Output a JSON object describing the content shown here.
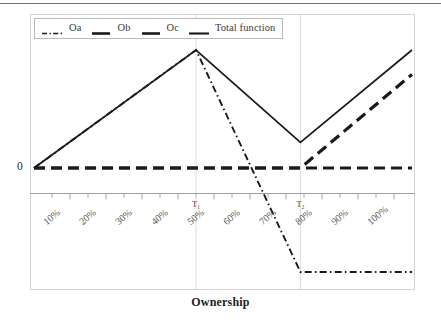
{
  "figure": {
    "axis_title": "Ownership",
    "y_zero_label": "0",
    "top_rule": true
  },
  "legend": {
    "position": "top-left-inside",
    "entries": [
      {
        "label": "Oa",
        "style": "dash-dot",
        "color": "#1a1a1a"
      },
      {
        "label": "Ob",
        "style": "dashed-thick",
        "color": "#1a1a1a"
      },
      {
        "label": "Oc",
        "style": "dashed-thick",
        "color": "#1a1a1a"
      },
      {
        "label": "Total function",
        "style": "solid",
        "color": "#1a1a1a"
      }
    ]
  },
  "axes": {
    "x_label": "Ownership",
    "x_tick_labels": [
      "10%",
      "20%",
      "30%",
      "40%",
      "50%",
      "60%",
      "70%",
      "80%",
      "90%",
      "100%"
    ],
    "x_tick_values": [
      10,
      20,
      30,
      40,
      50,
      60,
      70,
      80,
      90,
      100
    ],
    "x_minor_ticks": true,
    "y_tick_labels": [
      "0"
    ],
    "markers": [
      {
        "label": "T₁",
        "x_percent": 45
      },
      {
        "label": "T₂",
        "x_percent": 74
      }
    ]
  },
  "chart_data": {
    "type": "line",
    "title": "",
    "xlabel": "Ownership",
    "ylabel": "",
    "xlim": [
      0,
      105
    ],
    "ylim": [
      -1.05,
      1.0
    ],
    "grid": false,
    "legend_position": "upper left",
    "x_tick_labels": [
      "10%",
      "20%",
      "30%",
      "40%",
      "50%",
      "60%",
      "70%",
      "80%",
      "90%",
      "100%"
    ],
    "x_ticks": [
      10,
      20,
      30,
      40,
      50,
      60,
      70,
      80,
      90,
      100
    ],
    "y_ticks": [
      0
    ],
    "y_tick_labels": [
      "0"
    ],
    "annotations": [
      {
        "text": "T₁",
        "x": 45,
        "y": -0.17
      },
      {
        "text": "T₂",
        "x": 74,
        "y": -0.17
      }
    ],
    "series": [
      {
        "name": "Oa",
        "style": "dash-dot",
        "color": "#1a1a1a",
        "x": [
          0,
          45,
          74,
          105
        ],
        "y": [
          0.0,
          0.857,
          -0.755,
          -0.755
        ]
      },
      {
        "name": "Ob",
        "style": "dashed",
        "color": "#1a1a1a",
        "x": [
          0,
          45,
          74,
          105
        ],
        "y": [
          0.0,
          0.0,
          0.0,
          0.0
        ]
      },
      {
        "name": "Oc",
        "style": "dashed",
        "color": "#1a1a1a",
        "x": [
          0,
          45,
          74,
          105
        ],
        "y": [
          0.0,
          0.0,
          0.0,
          0.68
        ]
      },
      {
        "name": "Total function",
        "style": "solid",
        "color": "#1a1a1a",
        "x": [
          0,
          45,
          74,
          105
        ],
        "y": [
          0.0,
          0.857,
          0.186,
          0.857
        ]
      }
    ]
  }
}
